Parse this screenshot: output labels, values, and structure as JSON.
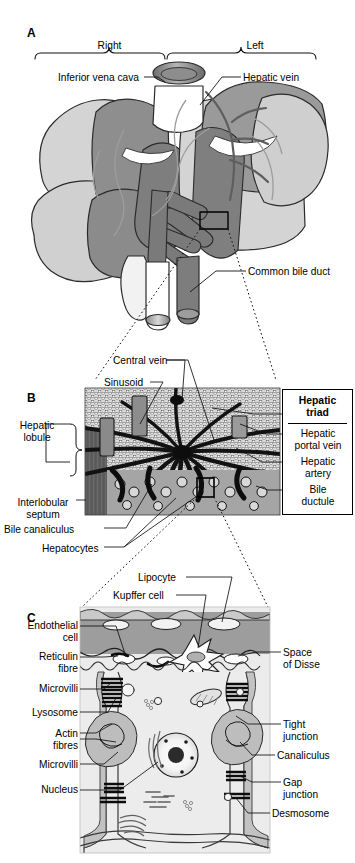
{
  "figure": {
    "background": "#ffffff",
    "ink": "#000000"
  },
  "panels": [
    {
      "id": "A",
      "letter": "A",
      "caption": "Gross anatomy of the liver showing right and left lobes, vasculature and biliary drainage",
      "lobe_labels": [
        {
          "name": "right-lobe-brace-label",
          "text": "Right"
        },
        {
          "name": "left-lobe-brace-label",
          "text": "Left"
        }
      ],
      "labels": [
        {
          "name": "inferior-vena-cava",
          "text": "Inferior vena cava"
        },
        {
          "name": "hepatic-vein",
          "text": "Hepatic vein"
        },
        {
          "name": "common-bile-duct",
          "text": "Common bile duct"
        }
      ],
      "callout": {
        "name": "panel-a-detail-box",
        "note": "rectangle marking region enlarged in panel B"
      }
    },
    {
      "id": "B",
      "letter": "B",
      "caption": "Histological organisation of the hepatic lobule",
      "labels_left": [
        {
          "name": "hepatic-lobule",
          "text": "Hepatic\nlobule"
        },
        {
          "name": "interlobular-septum",
          "text": "Interlobular\nseptum"
        },
        {
          "name": "bile-canaliculus",
          "text": "Bile canaliculus"
        },
        {
          "name": "hepatocytes",
          "text": "Hepatocytes"
        }
      ],
      "labels_top": [
        {
          "name": "central-vein",
          "text": "Central vein"
        },
        {
          "name": "sinusoid",
          "text": "Sinusoid"
        }
      ],
      "triad": {
        "name": "hepatic-triad-box",
        "title": "Hepatic\ntriad",
        "items": [
          {
            "name": "hepatic-portal-vein",
            "text": "Hepatic\nportal vein"
          },
          {
            "name": "hepatic-artery",
            "text": "Hepatic\nartery"
          },
          {
            "name": "bile-ductule",
            "text": "Bile\nductule"
          }
        ]
      },
      "callout": {
        "name": "panel-b-detail-box",
        "note": "rectangle marking region enlarged in panel C"
      }
    },
    {
      "id": "C",
      "letter": "C",
      "caption": "Ultrastructure of hepatocytes, sinusoid and space of Disse",
      "labels_top": [
        {
          "name": "lipocyte",
          "text": "Lipocyte"
        },
        {
          "name": "kupffer-cell",
          "text": "Kupffer cell"
        }
      ],
      "labels_left": [
        {
          "name": "endothelial-cell",
          "text": "Endothelial\ncell"
        },
        {
          "name": "reticulin-fibre",
          "text": "Reticulin\nfibre"
        },
        {
          "name": "microvilli-upper",
          "text": "Microvilli"
        },
        {
          "name": "lysosome",
          "text": "Lysosome"
        },
        {
          "name": "actin-fibres",
          "text": "Actin\nfibres"
        },
        {
          "name": "microvilli-lower",
          "text": "Microvilli"
        },
        {
          "name": "nucleus",
          "text": "Nucleus"
        }
      ],
      "labels_right": [
        {
          "name": "space-of-disse",
          "text": "Space\nof Disse"
        },
        {
          "name": "tight-junction",
          "text": "Tight\njunction"
        },
        {
          "name": "canaliculus",
          "text": "Canaliculus"
        },
        {
          "name": "gap-junction",
          "text": "Gap\njunction"
        },
        {
          "name": "desmosome",
          "text": "Desmosome"
        }
      ]
    }
  ],
  "palette": {
    "liver_light": "#d2d2d2",
    "liver_mid": "#9a9a9a",
    "liver_dark": "#707070",
    "vessel_dark": "#6e6e6e",
    "vessel_light": "#ffffff",
    "cyto": "#e9e9e9",
    "sinusoid_fill": "#8f8f8f",
    "outline": "#1a1a1a"
  }
}
